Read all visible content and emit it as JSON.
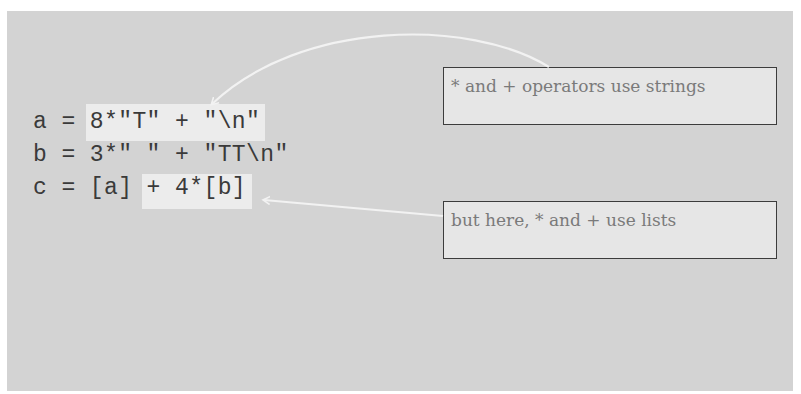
{
  "code": {
    "lines": [
      "a = 8*\"T\" + \"\\n\"",
      "b = 3*\" \" + \"TT\\n\"",
      "c = [a] + 4*[b]"
    ],
    "highlights": [
      {
        "label": "8*\"T\" + \"\\n\"",
        "meaning": "string-expression"
      },
      {
        "label": "+ 4*[b]",
        "meaning": "list-expression"
      }
    ]
  },
  "annotations": [
    {
      "text": "* and + operators use strings",
      "points_to": "line-a"
    },
    {
      "text": "but here, * and + use lists",
      "points_to": "line-c"
    }
  ],
  "colors": {
    "panel": "#d3d3d3",
    "highlight": "#ececec",
    "arrow": "#f2f2f2",
    "note_border": "#3c3c3c",
    "note_text": "#7a7a7a"
  }
}
